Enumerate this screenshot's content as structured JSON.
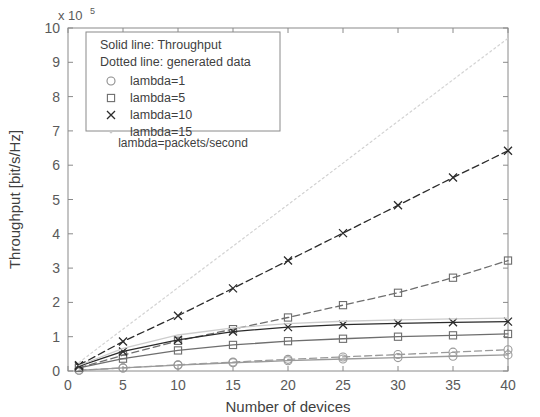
{
  "chart_data": {
    "type": "line",
    "title": "",
    "xlabel": "Number of devices",
    "ylabel": "Throughput [bit/s/Hz]",
    "y_exponent_label": "x 10",
    "y_exponent_power": "5",
    "xlim": [
      0,
      40
    ],
    "ylim": [
      0,
      10
    ],
    "xticks": [
      0,
      5,
      10,
      15,
      20,
      25,
      30,
      35,
      40
    ],
    "yticks": [
      0,
      1,
      2,
      3,
      4,
      5,
      6,
      7,
      8,
      9,
      10
    ],
    "xtick_labels": [
      "0",
      "5",
      "10",
      "15",
      "20",
      "25",
      "30",
      "35",
      "40"
    ],
    "ytick_labels": [
      "0",
      "1",
      "2",
      "3",
      "4",
      "5",
      "6",
      "7",
      "8",
      "9",
      "10"
    ],
    "grid": false,
    "legend_position": "top-left",
    "legend": {
      "header_lines": [
        "Solid line: Throughput",
        "Dotted line: generated data"
      ],
      "entries": [
        {
          "label": "lambda=1",
          "marker": "circle",
          "color": "#8c8c8c"
        },
        {
          "label": "lambda=5",
          "marker": "square",
          "color": "#6e6e6e"
        },
        {
          "label": "lambda=10",
          "marker": "cross",
          "color": "#2b2b2b"
        },
        {
          "label": "lambda=15",
          "marker": "dot",
          "color": "#c8c8c8"
        }
      ],
      "footnote": "lambda=packets/second"
    },
    "x": [
      1,
      5,
      10,
      15,
      20,
      25,
      30,
      35,
      40
    ],
    "series": [
      {
        "name": "lambda=1 throughput",
        "style": "solid",
        "marker": "circle",
        "color": "#9a9a9a",
        "values": [
          0.02,
          0.09,
          0.17,
          0.24,
          0.3,
          0.35,
          0.39,
          0.43,
          0.47
        ]
      },
      {
        "name": "lambda=1 generated data",
        "style": "dashed",
        "marker": "circle",
        "color": "#9a9a9a",
        "values": [
          0.02,
          0.09,
          0.18,
          0.26,
          0.34,
          0.41,
          0.48,
          0.55,
          0.62
        ]
      },
      {
        "name": "lambda=5 throughput",
        "style": "solid",
        "marker": "square",
        "color": "#6e6e6e",
        "values": [
          0.09,
          0.36,
          0.6,
          0.76,
          0.87,
          0.94,
          1.0,
          1.04,
          1.08
        ]
      },
      {
        "name": "lambda=5 generated data",
        "style": "dashed",
        "marker": "square",
        "color": "#6e6e6e",
        "values": [
          0.09,
          0.46,
          0.88,
          1.22,
          1.56,
          1.92,
          2.28,
          2.72,
          3.22
        ]
      },
      {
        "name": "lambda=10 throughput",
        "style": "solid",
        "marker": "cross",
        "color": "#2b2b2b",
        "values": [
          0.14,
          0.57,
          0.91,
          1.15,
          1.28,
          1.35,
          1.39,
          1.42,
          1.44
        ]
      },
      {
        "name": "lambda=10 generated data",
        "style": "dashed",
        "marker": "cross",
        "color": "#2b2b2b",
        "values": [
          0.17,
          0.86,
          1.61,
          2.41,
          3.22,
          4.02,
          4.83,
          5.64,
          6.42
        ]
      },
      {
        "name": "lambda=15 throughput",
        "style": "solid",
        "marker": "none",
        "color": "#cccccc",
        "values": [
          0.16,
          0.66,
          1.05,
          1.26,
          1.38,
          1.45,
          1.49,
          1.52,
          1.54
        ]
      },
      {
        "name": "lambda=15 generated data",
        "style": "dotted",
        "marker": "none",
        "color": "#d2d2d2",
        "values": [
          0.25,
          1.22,
          2.43,
          3.64,
          4.85,
          6.06,
          7.28,
          8.49,
          9.7
        ]
      }
    ]
  }
}
